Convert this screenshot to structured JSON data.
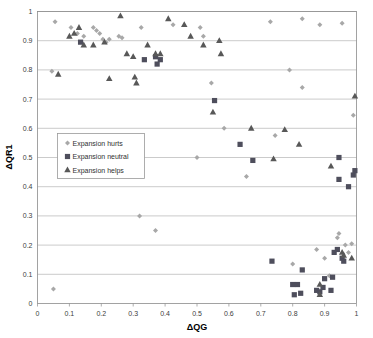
{
  "chart_data": {
    "type": "scatter",
    "title": "",
    "xlabel": "ΔQG",
    "ylabel": "ΔQR1",
    "xlim": [
      0,
      1
    ],
    "ylim": [
      0,
      1
    ],
    "xticks": [
      "0",
      "0.1",
      "0.2",
      "0.3",
      "0.4",
      "0.5",
      "0.6",
      "0.7",
      "0.8",
      "0.9",
      "1"
    ],
    "yticks": [
      "0",
      "0.1",
      "0.2",
      "0.3",
      "0.4",
      "0.5",
      "0.6",
      "0.7",
      "0.8",
      "0.9",
      "1"
    ],
    "grid": "horizontal",
    "legend_position": "middle-left",
    "series": [
      {
        "name": "Expansion hurts",
        "marker": "diamond",
        "color": "#a8a8a8",
        "points": [
          [
            0.05,
            0.05
          ],
          [
            0.045,
            0.795
          ],
          [
            0.055,
            0.965
          ],
          [
            0.105,
            0.945
          ],
          [
            0.125,
            0.925
          ],
          [
            0.145,
            0.915
          ],
          [
            0.175,
            0.945
          ],
          [
            0.185,
            0.935
          ],
          [
            0.195,
            0.925
          ],
          [
            0.205,
            0.905
          ],
          [
            0.215,
            0.895
          ],
          [
            0.225,
            0.905
          ],
          [
            0.255,
            0.915
          ],
          [
            0.265,
            0.91
          ],
          [
            0.32,
            0.3
          ],
          [
            0.325,
            0.945
          ],
          [
            0.37,
            0.25
          ],
          [
            0.425,
            0.955
          ],
          [
            0.5,
            0.5
          ],
          [
            0.51,
            0.945
          ],
          [
            0.52,
            0.915
          ],
          [
            0.545,
            0.755
          ],
          [
            0.585,
            0.6
          ],
          [
            0.655,
            0.435
          ],
          [
            0.73,
            0.965
          ],
          [
            0.745,
            0.575
          ],
          [
            0.79,
            0.8
          ],
          [
            0.8,
            0.135
          ],
          [
            0.83,
            0.74
          ],
          [
            0.83,
            0.975
          ],
          [
            0.875,
            0.185
          ],
          [
            0.885,
            0.955
          ],
          [
            0.9,
            0.155
          ],
          [
            0.915,
            0.095
          ],
          [
            0.94,
            0.225
          ],
          [
            0.945,
            0.24
          ],
          [
            0.955,
            0.96
          ],
          [
            0.965,
            0.2
          ],
          [
            0.975,
            0.175
          ],
          [
            0.985,
            0.205
          ],
          [
            0.99,
            0.645
          ]
        ]
      },
      {
        "name": "Expansion neutral",
        "marker": "square",
        "color": "#4e4e5c",
        "points": [
          [
            0.135,
            0.895
          ],
          [
            0.335,
            0.835
          ],
          [
            0.37,
            0.845
          ],
          [
            0.375,
            0.82
          ],
          [
            0.385,
            0.835
          ],
          [
            0.555,
            0.695
          ],
          [
            0.635,
            0.545
          ],
          [
            0.675,
            0.49
          ],
          [
            0.735,
            0.145
          ],
          [
            0.8,
            0.065
          ],
          [
            0.805,
            0.03
          ],
          [
            0.815,
            0.065
          ],
          [
            0.825,
            0.035
          ],
          [
            0.83,
            0.115
          ],
          [
            0.875,
            0.045
          ],
          [
            0.885,
            0.04
          ],
          [
            0.895,
            0.055
          ],
          [
            0.9,
            0.085
          ],
          [
            0.92,
            0.045
          ],
          [
            0.925,
            0.09
          ],
          [
            0.93,
            0.175
          ],
          [
            0.94,
            0.185
          ],
          [
            0.945,
            0.425
          ],
          [
            0.945,
            0.5
          ],
          [
            0.955,
            0.155
          ],
          [
            0.96,
            0.145
          ],
          [
            0.975,
            0.4
          ],
          [
            0.99,
            0.44
          ],
          [
            0.995,
            0.455
          ]
        ]
      },
      {
        "name": "Expansion helps",
        "marker": "triangle",
        "color": "#585858",
        "points": [
          [
            0.065,
            0.785
          ],
          [
            0.1,
            0.915
          ],
          [
            0.115,
            0.925
          ],
          [
            0.13,
            0.945
          ],
          [
            0.145,
            0.885
          ],
          [
            0.175,
            0.885
          ],
          [
            0.21,
            0.895
          ],
          [
            0.225,
            0.77
          ],
          [
            0.26,
            0.985
          ],
          [
            0.28,
            0.855
          ],
          [
            0.3,
            0.845
          ],
          [
            0.305,
            0.775
          ],
          [
            0.31,
            0.755
          ],
          [
            0.345,
            0.885
          ],
          [
            0.37,
            0.855
          ],
          [
            0.385,
            0.855
          ],
          [
            0.41,
            0.975
          ],
          [
            0.46,
            0.955
          ],
          [
            0.48,
            0.915
          ],
          [
            0.52,
            0.885
          ],
          [
            0.55,
            0.655
          ],
          [
            0.57,
            0.9
          ],
          [
            0.575,
            0.855
          ],
          [
            0.67,
            0.6
          ],
          [
            0.74,
            0.495
          ],
          [
            0.775,
            0.595
          ],
          [
            0.82,
            0.545
          ],
          [
            0.885,
            0.065
          ],
          [
            0.885,
            0.03
          ],
          [
            0.92,
            0.47
          ],
          [
            0.955,
            0.175
          ],
          [
            0.96,
            0.165
          ],
          [
            0.985,
            0.155
          ],
          [
            0.995,
            0.71
          ]
        ]
      }
    ]
  },
  "legend": {
    "items": [
      {
        "label": "Expansion hurts"
      },
      {
        "label": "Expansion neutral"
      },
      {
        "label": "Expansion helps"
      }
    ]
  },
  "colors": {
    "plot_border": "#8c8c8c",
    "gridline": "#b5b5b5",
    "background": "#ffffff",
    "hurts": "#a8a8a8",
    "neutral": "#4e4e5c",
    "helps": "#585858"
  }
}
